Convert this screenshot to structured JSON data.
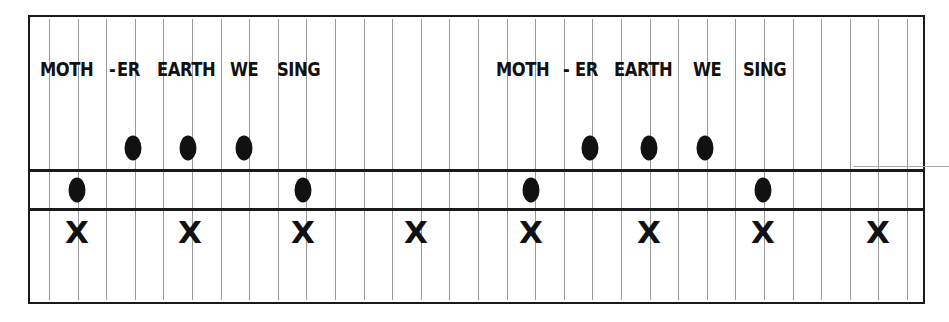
{
  "diagram": {
    "type": "music-notation-grid",
    "colors": {
      "border": "#1a1a1a",
      "gridline": "#9a9a9a",
      "ink": "#111111",
      "background": "#ffffff"
    },
    "grid": {
      "x_start": 49,
      "spacing": 28.6,
      "count": 31
    },
    "staff_lines_y": [
      170,
      209
    ],
    "phrases": [
      {
        "lyrics": [
          {
            "text": "MOTH",
            "x": 40
          },
          {
            "text": "-",
            "x": 109
          },
          {
            "text": "ER",
            "x": 117
          },
          {
            "text": "EARTH",
            "x": 157
          },
          {
            "text": "WE",
            "x": 230
          },
          {
            "text": "SING",
            "x": 277
          }
        ],
        "notes": [
          {
            "x": 77,
            "level": "low"
          },
          {
            "x": 133,
            "level": "high"
          },
          {
            "x": 188,
            "level": "high"
          },
          {
            "x": 244,
            "level": "high"
          },
          {
            "x": 303,
            "level": "low"
          }
        ],
        "beats": [
          {
            "x": 77,
            "label": "X"
          },
          {
            "x": 190,
            "label": "X"
          },
          {
            "x": 303,
            "label": "X"
          },
          {
            "x": 416,
            "label": "X"
          }
        ]
      },
      {
        "lyrics": [
          {
            "text": "MOTH",
            "x": 496
          },
          {
            "text": "-",
            "x": 563
          },
          {
            "text": "ER",
            "x": 575
          },
          {
            "text": "EARTH",
            "x": 614
          },
          {
            "text": "WE",
            "x": 693
          },
          {
            "text": "SING",
            "x": 743
          }
        ],
        "notes": [
          {
            "x": 531,
            "level": "low"
          },
          {
            "x": 590,
            "level": "high"
          },
          {
            "x": 649,
            "level": "high"
          },
          {
            "x": 705,
            "level": "high"
          },
          {
            "x": 763,
            "level": "low"
          }
        ],
        "beats": [
          {
            "x": 531,
            "label": "X"
          },
          {
            "x": 649,
            "label": "X"
          },
          {
            "x": 763,
            "label": "X"
          },
          {
            "x": 878,
            "label": "X"
          }
        ]
      }
    ]
  }
}
